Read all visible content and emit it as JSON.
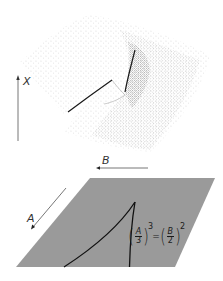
{
  "figure": {
    "upper_panel": {
      "description": "Stippled folded behavior surface",
      "axis_x_label": "X",
      "axis_b_label": "B"
    },
    "lower_panel": {
      "description": "Control plane with cusp bifurcation set",
      "axis_a_label": "A",
      "equation": {
        "left_num": "A",
        "left_den": "3",
        "left_exp": "3",
        "equals": "=",
        "right_num": "B",
        "right_den": "2",
        "right_exp": "2"
      }
    },
    "colors": {
      "plane_fill": "#9a9a9a",
      "stipple": "#2a2a2a",
      "curve": "#111111",
      "axis": "#555555"
    }
  }
}
